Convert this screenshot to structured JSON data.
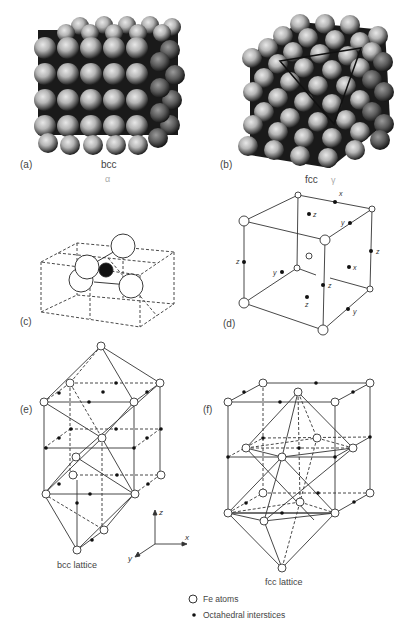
{
  "header": {
    "text": ""
  },
  "panels": {
    "a": {
      "letter": "(a)",
      "structure": "bcc",
      "phase": "α"
    },
    "b": {
      "letter": "(b)",
      "structure": "fcc",
      "phase": "γ"
    },
    "c": {
      "letter": "(c)"
    },
    "d": {
      "letter": "(d)",
      "axis_labels": {
        "x1": "x",
        "z1": "z",
        "y1": "y",
        "z2": "z",
        "z3": "z",
        "y2": "y",
        "x2": "x",
        "z4": "z",
        "z5": "z",
        "y3": "y"
      }
    },
    "e": {
      "letter": "(e)",
      "caption": "bcc lattice"
    },
    "f": {
      "letter": "(f)",
      "caption": "fcc lattice"
    }
  },
  "axes": {
    "x": "x",
    "y": "y",
    "z": "z"
  },
  "legend": {
    "items": [
      {
        "symbol": "open-circle",
        "label": "Fe atoms"
      },
      {
        "symbol": "filled-dot",
        "label": "Octahedral interstices"
      }
    ]
  }
}
